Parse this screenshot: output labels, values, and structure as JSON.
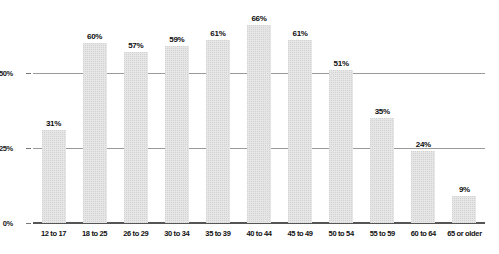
{
  "chart_data": {
    "type": "bar",
    "title": "",
    "xlabel": "",
    "ylabel": "",
    "categories": [
      "12 to 17",
      "18 to 25",
      "26 to 29",
      "30 to 34",
      "35 to 39",
      "40 to 44",
      "45 to 49",
      "50 to 54",
      "55 to 59",
      "60 to 64",
      "65 or older"
    ],
    "values": [
      31,
      60,
      57,
      59,
      61,
      66,
      61,
      51,
      35,
      24,
      9
    ],
    "value_labels": [
      "31%",
      "60%",
      "57%",
      "59%",
      "61%",
      "66%",
      "61%",
      "51%",
      "35%",
      "24%",
      "9%"
    ],
    "ylim": [
      0,
      75
    ],
    "yticks": [
      0,
      25,
      50
    ],
    "ytick_labels": [
      "0%",
      "25%",
      "50%"
    ],
    "grid": true,
    "legend": "none",
    "bar_color": "#e6e6e6",
    "gridline_color": "#9a9a9a",
    "baseline_color": "#555555",
    "text_color": "#111111"
  }
}
